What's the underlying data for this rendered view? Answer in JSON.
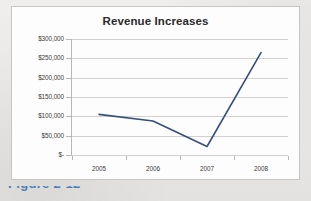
{
  "figure": {
    "caption": "Figure 2-12"
  },
  "chart_data": {
    "type": "line",
    "title": "Revenue Increases",
    "xlabel": "",
    "ylabel": "",
    "categories": [
      "2005",
      "2006",
      "2007",
      "2008"
    ],
    "series": [
      {
        "name": "Revenue",
        "values": [
          105000,
          88000,
          22000,
          265000
        ]
      }
    ],
    "ylim": [
      0,
      300000
    ],
    "ytick_values": [
      0,
      50000,
      100000,
      150000,
      200000,
      250000,
      300000
    ],
    "ytick_labels": [
      "$-",
      "$50,000",
      "$100,000",
      "$150,000",
      "$200,000",
      "$250,000",
      "$300,000"
    ],
    "grid": "horizontal",
    "legend": "none",
    "line_color": "#34507f",
    "gridline_color": "#d3d1cf",
    "markers": false
  }
}
